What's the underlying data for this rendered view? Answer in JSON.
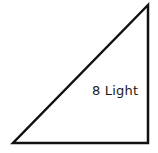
{
  "diagram": {
    "type": "right-triangle",
    "stroke_color": "#111111",
    "fill_color": "#ffffff",
    "stroke_width": 2.5,
    "vertices": {
      "top": [
        148,
        5
      ],
      "bottom_left": [
        13,
        143
      ],
      "bottom_right": [
        148,
        143
      ]
    },
    "label": "8 Light"
  }
}
